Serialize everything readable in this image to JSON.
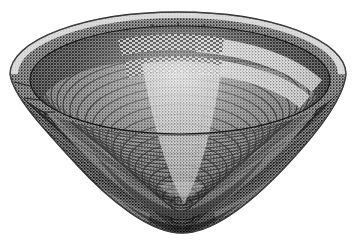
{
  "image": {
    "subject": "coiled conical basket",
    "alt_text": "Halftone engraving of a wide conical coiled basket viewed from above at an angle, showing the interior bowl and patterned bands",
    "background_color": "#ffffff",
    "width": 357,
    "height": 251,
    "rendering_style": "halftone engraving / dithered line screen",
    "view_angle": "three-quarter from above"
  },
  "palette": {
    "background": "#ffffff",
    "ink_darkest": "#101010",
    "ink_dark": "#2b2b2b",
    "ink_mid": "#555555",
    "ink_light": "#9a9a9a",
    "ink_highlight": "#e6e6e6",
    "outline": "#1a1a1a"
  },
  "geometry": {
    "rim_center_x": 178,
    "rim_center_y": 74,
    "rim_radius_x": 168,
    "rim_radius_y": 62,
    "apex_x": 182,
    "apex_y": 233,
    "interior_center_x": 180,
    "interior_center_y": 80,
    "interior_radius_x": 150,
    "interior_radius_y": 54,
    "rim_thickness": 9
  },
  "structure": {
    "coil_count": 46,
    "interior_coil_count": 30,
    "exterior_coil_count": 18,
    "stitch_spacing_deg": 2.2
  },
  "bands": [
    {
      "name": "rim-highlight-band",
      "tone": "light",
      "position": "outer rim edge",
      "radius_fraction": 0.97
    },
    {
      "name": "upper-dark-band",
      "tone": "dark",
      "position": "just inside rim",
      "radius_fraction": 0.88
    },
    {
      "name": "light-diagonal-band-right",
      "tone": "light",
      "position": "upper right interior",
      "radius_fraction": 0.74
    },
    {
      "name": "checker-pattern-band",
      "tone": "mixed",
      "position": "upper center interior",
      "radius_fraction": 0.66
    },
    {
      "name": "light-wedge-center",
      "tone": "light",
      "position": "center interior vertical wedge",
      "radius_fraction": 0.4
    },
    {
      "name": "dark-wedge-left",
      "tone": "dark",
      "position": "left interior wedge",
      "radius_fraction": 0.55
    },
    {
      "name": "dark-wedge-right",
      "tone": "dark",
      "position": "right interior wedge",
      "radius_fraction": 0.55
    },
    {
      "name": "lower-rim-shadow",
      "tone": "dark",
      "position": "lower interior curve",
      "radius_fraction": 0.82
    },
    {
      "name": "base-texture",
      "tone": "mid",
      "position": "exterior lower cone",
      "radius_fraction": 1.0
    }
  ],
  "wedges": [
    {
      "name": "wedge-center-light",
      "start_deg": -108,
      "end_deg": -72,
      "tone": "light"
    },
    {
      "name": "wedge-left-dark",
      "start_deg": -160,
      "end_deg": -120,
      "tone": "dark"
    },
    {
      "name": "wedge-right-dark",
      "start_deg": -60,
      "end_deg": -20,
      "tone": "dark"
    },
    {
      "name": "wedge-lower-left",
      "start_deg": 150,
      "end_deg": 185,
      "tone": "mid"
    },
    {
      "name": "wedge-lower-right",
      "start_deg": -5,
      "end_deg": 30,
      "tone": "mid"
    }
  ]
}
